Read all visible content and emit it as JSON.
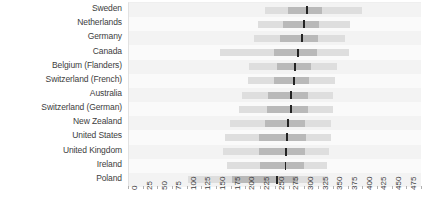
{
  "chart_data": {
    "type": "bar",
    "subtype": "box-and-whisker-horizontal",
    "title": "",
    "subtitle": "",
    "xlabel": "",
    "ylabel": "",
    "xlim": [
      0,
      500
    ],
    "xtick_step": 25,
    "xticks": [
      0,
      25,
      50,
      75,
      100,
      125,
      150,
      175,
      200,
      225,
      250,
      275,
      300,
      325,
      350,
      375,
      400,
      425,
      450,
      475,
      500
    ],
    "grid": false,
    "legend": "none",
    "orientation": "horizontal",
    "categories": [
      "Sweden",
      "Netherlands",
      "Germany",
      "Canada",
      "Belgium (Flanders)",
      "Switzerland (French)",
      "Australia",
      "Switzerland (German)",
      "New Zealand",
      "United States",
      "United Kingdom",
      "Ireland",
      "Poland"
    ],
    "series": [
      {
        "name": "whisker_low",
        "values": [
          232,
          220,
          213,
          155,
          205,
          203,
          193,
          187,
          172,
          163,
          160,
          167,
          100
        ]
      },
      {
        "name": "box_low",
        "values": [
          272,
          262,
          258,
          248,
          252,
          247,
          238,
          236,
          232,
          222,
          221,
          224,
          175
        ]
      },
      {
        "name": "median",
        "values": [
          304,
          298,
          295,
          288,
          283,
          281,
          276,
          276,
          271,
          270,
          268,
          267,
          252
        ]
      },
      {
        "name": "box_high",
        "values": [
          330,
          325,
          322,
          320,
          310,
          308,
          305,
          305,
          300,
          302,
          300,
          298,
          288
        ]
      },
      {
        "name": "whisker_high",
        "values": [
          398,
          378,
          368,
          375,
          355,
          352,
          348,
          348,
          345,
          345,
          342,
          338,
          340
        ]
      }
    ],
    "colors": {
      "whisker": "#dedede",
      "box": "#b9b9b9",
      "median": "#232323",
      "row_band": "#f3f3f3",
      "row_band_alt": "#fafafa",
      "panel_background": "#fbfbfb",
      "text": "#3d3d3d"
    }
  }
}
